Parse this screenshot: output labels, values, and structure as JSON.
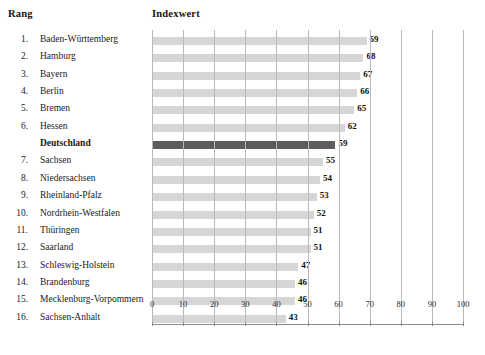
{
  "headers": {
    "rank_label": "Rang",
    "value_label": "Indexwert"
  },
  "colors": {
    "bar": "#d6d6d6",
    "highlight_bar": "#5c5c5c",
    "gridline": "#b9b9b9",
    "axis": "#8a8a8a",
    "text": "#1a1a1a"
  },
  "chart_data": {
    "type": "bar",
    "orientation": "horizontal",
    "title": "",
    "xlabel": "",
    "ylabel": "",
    "xlim": [
      0,
      100
    ],
    "xticks": [
      0,
      10,
      20,
      30,
      40,
      50,
      60,
      70,
      80,
      90,
      100
    ],
    "xtick_labels": [
      "0",
      "10",
      "20",
      "30",
      "40",
      "50",
      "60",
      "70",
      "80",
      "90",
      "100"
    ],
    "grid": true,
    "legend": "none",
    "categories": [
      "Baden-Württemberg",
      "Hamburg",
      "Bayern",
      "Berlin",
      "Bremen",
      "Hessen",
      "Deutschland",
      "Sachsen",
      "Niedersachsen",
      "Rheinland-Pfalz",
      "Nordrhein-Westfalen",
      "Thüringen",
      "Saarland",
      "Schleswig-Holstein",
      "Brandenburg",
      "Mecklenburg-Vorpommern",
      "Sachsen-Anhalt"
    ],
    "values": [
      69,
      68,
      67,
      66,
      65,
      62,
      59,
      55,
      54,
      53,
      52,
      51,
      51,
      47,
      46,
      46,
      43
    ]
  },
  "rows": [
    {
      "rank": "1.",
      "name": "Baden-Württemberg",
      "value": 69,
      "highlight": false
    },
    {
      "rank": "2.",
      "name": "Hamburg",
      "value": 68,
      "highlight": false
    },
    {
      "rank": "3.",
      "name": "Bayern",
      "value": 67,
      "highlight": false
    },
    {
      "rank": "4.",
      "name": "Berlin",
      "value": 66,
      "highlight": false
    },
    {
      "rank": "5.",
      "name": "Bremen",
      "value": 65,
      "highlight": false
    },
    {
      "rank": "6.",
      "name": "Hessen",
      "value": 62,
      "highlight": false
    },
    {
      "rank": "",
      "name": "Deutschland",
      "value": 59,
      "highlight": true
    },
    {
      "rank": "7.",
      "name": "Sachsen",
      "value": 55,
      "highlight": false
    },
    {
      "rank": "8.",
      "name": "Niedersachsen",
      "value": 54,
      "highlight": false
    },
    {
      "rank": "9.",
      "name": "Rheinland-Pfalz",
      "value": 53,
      "highlight": false
    },
    {
      "rank": "10.",
      "name": "Nordrhein-Westfalen",
      "value": 52,
      "highlight": false
    },
    {
      "rank": "11.",
      "name": "Thüringen",
      "value": 51,
      "highlight": false
    },
    {
      "rank": "12.",
      "name": "Saarland",
      "value": 51,
      "highlight": false
    },
    {
      "rank": "13.",
      "name": "Schleswig-Holstein",
      "value": 47,
      "highlight": false
    },
    {
      "rank": "14.",
      "name": "Brandenburg",
      "value": 46,
      "highlight": false
    },
    {
      "rank": "15.",
      "name": "Mecklenburg-Vorpommern",
      "value": 46,
      "highlight": false
    },
    {
      "rank": "16.",
      "name": "Sachsen-Anhalt",
      "value": 43,
      "highlight": false
    }
  ]
}
